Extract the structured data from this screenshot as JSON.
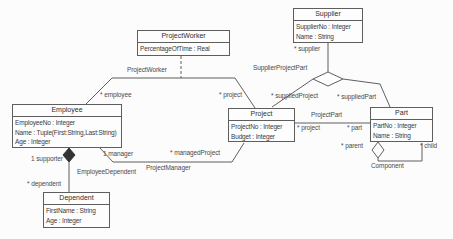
{
  "diagram": {
    "type": "uml-class-diagram",
    "colors": {
      "background": "#fcfcfc",
      "line": "#5f5f5f",
      "text": "#3a3a3a",
      "box_fill": "#fdfdfd"
    },
    "classes": [
      {
        "name": "ProjectWorker",
        "attributes": [
          "PercentageOfTime : Real"
        ]
      },
      {
        "name": "Supplier",
        "attributes": [
          "SupplierNo : Integer",
          "Name : String"
        ]
      },
      {
        "name": "Employee",
        "attributes": [
          "EmployeeNo : Integer",
          "Name : Tuple(First:String,Last:String)",
          "Age : Integer"
        ]
      },
      {
        "name": "Project",
        "attributes": [
          "ProjectNo : Integer",
          "Budget : Integer"
        ]
      },
      {
        "name": "Part",
        "attributes": [
          "PartNo : Integer",
          "Name : String"
        ]
      },
      {
        "name": "Dependent",
        "attributes": [
          "FirstName : String",
          "Age : Integer"
        ]
      }
    ],
    "labels": {
      "assoc_projectworker": "ProjectWorker",
      "role_employee": "* employee",
      "role_project_top": "* project",
      "role_supplier": "* supplier",
      "assoc_supplierprojectpart": "SupplierProjectPart",
      "role_suppliedproject": "* suppliedProject",
      "role_suppliedpart": "* suppliedPart",
      "assoc_projectpart": "ProjectPart",
      "role_project_mid": "* project",
      "role_part": "* part",
      "role_parent": "* parent",
      "role_child": "* child",
      "assoc_component": "Component",
      "role_manager": "1 manager",
      "role_managedproject": "* managedProject",
      "assoc_projectmanager": "ProjectManager",
      "role_supporter": "1 supporter",
      "assoc_employeedependent": "EmployeeDependent",
      "role_dependent": "* dependent"
    }
  }
}
